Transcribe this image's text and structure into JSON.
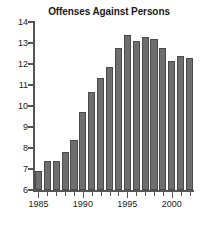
{
  "chart_data": {
    "type": "bar",
    "title": "Offenses Against Persons",
    "xlabel": "",
    "ylabel": "",
    "ylim": [
      6,
      14
    ],
    "ytick_labels": [
      "14",
      "13",
      "12",
      "11",
      "10",
      "9",
      "8",
      "7",
      "6"
    ],
    "yticks": [
      14,
      13,
      12,
      11,
      10,
      9,
      8,
      7,
      6
    ],
    "xtick_labels": [
      "1985",
      "1990",
      "1995",
      "2000"
    ],
    "xticks": [
      1985,
      1990,
      1995,
      2000
    ],
    "grid": false,
    "legend": null,
    "bar_color": "#6e6e6e",
    "bar_edge_color": "#4a4a4a",
    "axis_color": "#555555",
    "text_color": "#1a1a1a",
    "background": "#ffffff",
    "categories": [
      "1985",
      "1986",
      "1987",
      "1988",
      "1989",
      "1990",
      "1991",
      "1992",
      "1993",
      "1994",
      "1995",
      "1996",
      "1997",
      "1998",
      "1999",
      "2000",
      "2001",
      "2002"
    ],
    "values": [
      6.9,
      7.4,
      7.4,
      7.8,
      8.4,
      9.7,
      10.65,
      11.35,
      11.85,
      12.75,
      13.4,
      13.1,
      13.3,
      13.2,
      12.75,
      12.15,
      12.4,
      12.3
    ]
  }
}
